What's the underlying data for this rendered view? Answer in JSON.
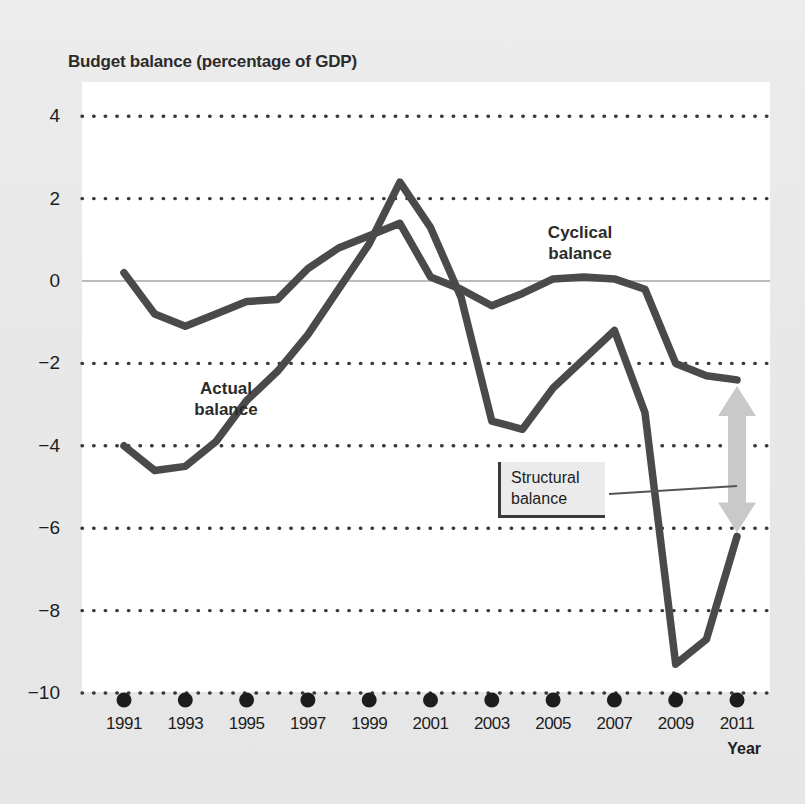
{
  "chart_data": {
    "type": "line",
    "title": "Budget balance (percentage of GDP)",
    "xlabel": "Year",
    "ylabel": "",
    "xlim": [
      1990.6,
      2011.6
    ],
    "ylim": [
      -10,
      4
    ],
    "yticks": [
      4,
      2,
      0,
      -2,
      -4,
      -6,
      -8,
      -10
    ],
    "xticks": [
      1991,
      1993,
      1995,
      1997,
      1999,
      2001,
      2003,
      2005,
      2007,
      2009,
      2011
    ],
    "grid": "horizontal-dotted",
    "zero_line": true,
    "legend": "inline-annotations",
    "x": [
      1991,
      1992,
      1993,
      1994,
      1995,
      1996,
      1997,
      1998,
      1999,
      2000,
      2001,
      2002,
      2003,
      2004,
      2005,
      2006,
      2007,
      2008,
      2009,
      2010,
      2011
    ],
    "series": [
      {
        "name": "Actual balance",
        "color": "#4a4a4a",
        "values": [
          -4.0,
          -4.6,
          -4.5,
          -3.9,
          -2.9,
          -2.2,
          -1.3,
          -0.2,
          0.9,
          2.4,
          1.3,
          -0.4,
          -3.4,
          -3.6,
          -2.6,
          -1.9,
          -1.2,
          -3.2,
          -9.3,
          -8.7,
          -6.2
        ]
      },
      {
        "name": "Cyclical balance",
        "color": "#4a4a4a",
        "values": [
          0.2,
          -0.8,
          -1.1,
          -0.8,
          -0.5,
          -0.45,
          0.3,
          0.8,
          1.1,
          1.4,
          0.1,
          -0.2,
          -0.6,
          -0.3,
          0.05,
          0.1,
          0.05,
          -0.2,
          -2.0,
          -2.3,
          -2.4
        ]
      }
    ],
    "annotations": [
      {
        "name": "actual-balance-label",
        "text": "Actual\nbalance",
        "line1": "Actual",
        "line2": "balance",
        "x_px": 224,
        "y_px": 390
      },
      {
        "name": "cyclical-balance-label",
        "text": "Cyclical\nbalance",
        "line1": "Cyclical",
        "line2": "balance",
        "x_px": 578,
        "y_px": 233
      },
      {
        "name": "structural-balance-callout",
        "line1": "Structural",
        "line2": "balance"
      }
    ],
    "structural_arrow": {
      "name": "structural-balance-arrow",
      "label": "Structural balance",
      "color": "#c9c9c9",
      "x_px": 737,
      "top_value": -2.4,
      "bottom_value": -6.2
    }
  },
  "chart": {
    "title": "Budget balance (percentage of GDP)",
    "xaxis_title": "Year",
    "ytick_labels": [
      "4",
      "2",
      "0",
      "−2",
      "−4",
      "−6",
      "−8",
      "−10"
    ],
    "xtick_labels": [
      "1991",
      "1993",
      "1995",
      "1997",
      "1999",
      "2001",
      "2003",
      "2005",
      "2007",
      "2009",
      "2011"
    ],
    "series_labels": {
      "actual_line1": "Actual",
      "actual_line2": "balance",
      "cyclical_line1": "Cyclical",
      "cyclical_line2": "balance"
    },
    "callout": {
      "line1": "Structural",
      "line2": "balance"
    }
  },
  "colors": {
    "line": "#4a4a4a",
    "grid": "#3a3a3a",
    "zero_line": "#bcbcbc",
    "arrow": "#c9c9c9",
    "plot_bg": "#ffffff",
    "figure_bg": "#e9e9e9",
    "text": "#1d1d1d"
  }
}
